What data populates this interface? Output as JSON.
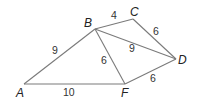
{
  "diagram": {
    "type": "geometry-figure",
    "vertices": [
      {
        "id": "A",
        "label": "A",
        "x": 24,
        "y": 84,
        "lx": 16,
        "ly": 97
      },
      {
        "id": "B",
        "label": "B",
        "x": 95,
        "y": 29,
        "lx": 84,
        "ly": 27
      },
      {
        "id": "C",
        "label": "C",
        "x": 133,
        "y": 19,
        "lx": 130,
        "ly": 16
      },
      {
        "id": "D",
        "label": "D",
        "x": 176,
        "y": 59,
        "lx": 178,
        "ly": 64
      },
      {
        "id": "F",
        "label": "F",
        "x": 125,
        "y": 84,
        "lx": 121,
        "ly": 97
      }
    ],
    "edges": [
      {
        "from": "A",
        "to": "B",
        "length": "9",
        "lx": 52,
        "ly": 54
      },
      {
        "from": "B",
        "to": "C",
        "length": "4",
        "lx": 111,
        "ly": 19
      },
      {
        "from": "C",
        "to": "D",
        "length": "6",
        "lx": 153,
        "ly": 35
      },
      {
        "from": "B",
        "to": "D",
        "length": "9",
        "lx": 129,
        "ly": 52
      },
      {
        "from": "B",
        "to": "F",
        "length": "6",
        "lx": 101,
        "ly": 64
      },
      {
        "from": "F",
        "to": "D",
        "length": "6",
        "lx": 150,
        "ly": 82
      },
      {
        "from": "A",
        "to": "F",
        "length": "10",
        "lx": 63,
        "ly": 96
      }
    ]
  }
}
